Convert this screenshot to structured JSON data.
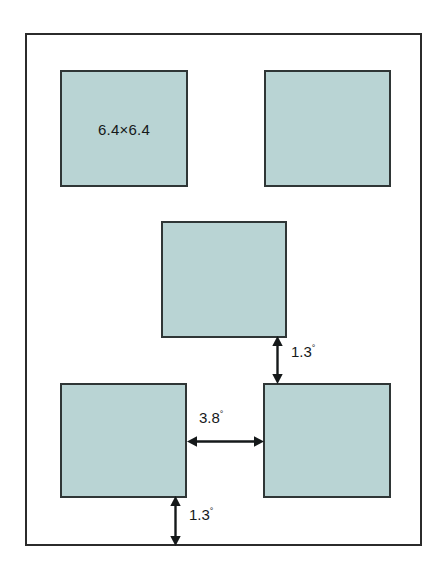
{
  "figure": {
    "background_color": "#ffffff",
    "frame_border_color": "#2b2b2b",
    "square_fill_color": "#b9d4d4",
    "square_border_color": "#2f3636",
    "text_color": "#15191a"
  },
  "squares": [
    {
      "name": "top-left-square",
      "label": "6.4×6.4",
      "has_label": true,
      "x": 60,
      "y": 70,
      "w": 128,
      "h": 117
    },
    {
      "name": "top-right-square",
      "label": "",
      "has_label": false,
      "x": 264,
      "y": 70,
      "w": 127,
      "h": 117
    },
    {
      "name": "middle-center-square",
      "label": "",
      "has_label": false,
      "x": 161,
      "y": 221,
      "w": 126,
      "h": 117
    },
    {
      "name": "bottom-left-square",
      "label": "",
      "has_label": false,
      "x": 60,
      "y": 383,
      "w": 127,
      "h": 115
    },
    {
      "name": "bottom-right-square",
      "label": "",
      "has_label": false,
      "x": 263,
      "y": 383,
      "w": 128,
      "h": 115
    }
  ],
  "dimensions": [
    {
      "name": "vertical-gap-upper",
      "value": "1.3",
      "unit": "°",
      "orientation": "vertical",
      "label_x": 291,
      "label_y": 343
    },
    {
      "name": "horizontal-gap",
      "value": "3.8",
      "unit": "°",
      "orientation": "horizontal",
      "label_x": 199,
      "label_y": 409
    },
    {
      "name": "vertical-gap-lower",
      "value": "1.3",
      "unit": "°",
      "orientation": "vertical",
      "label_x": 189,
      "label_y": 506
    }
  ]
}
